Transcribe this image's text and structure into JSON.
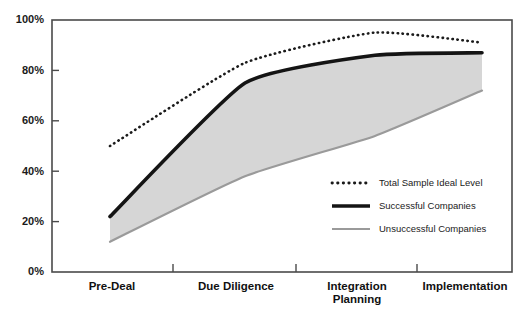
{
  "chart_data": {
    "type": "line",
    "title": "",
    "subtitle": "",
    "xlabel": "",
    "ylabel": "",
    "categories": [
      "Pre-Deal",
      "Due Diligence",
      "Integration Planning",
      "Implementation"
    ],
    "category_lines": [
      [
        "Pre-Deal"
      ],
      [
        "Due Diligence"
      ],
      [
        "Integration",
        "Planning"
      ],
      [
        "Implementation"
      ]
    ],
    "x": [
      0,
      1,
      2,
      3
    ],
    "ylim": [
      0,
      100
    ],
    "xlim": [
      -0.2,
      3.2
    ],
    "grid": false,
    "legend_position": "inside-lower-right",
    "y_ticks": [
      0,
      20,
      40,
      60,
      80,
      100
    ],
    "y_tick_labels": [
      "0%",
      "20%",
      "40%",
      "60%",
      "80%",
      "100%"
    ],
    "series": [
      {
        "name": "Total Sample Ideal Level",
        "style": "dotted",
        "color": "#1a1a1a",
        "values": [
          50,
          83,
          95,
          91
        ]
      },
      {
        "name": "Successful Companies",
        "style": "solid-thick",
        "color": "#141414",
        "values": [
          22,
          75,
          86,
          87
        ]
      },
      {
        "name": "Unsuccessful Companies",
        "style": "solid-thin",
        "color": "#9a9a9a",
        "values": [
          12,
          38,
          54,
          72
        ]
      }
    ],
    "band": {
      "name": "range-between-successful-and-unsuccessful",
      "fill": "#d6d6d6",
      "upper_series": "Successful Companies",
      "lower_series": "Unsuccessful Companies"
    }
  },
  "legend": {
    "items": [
      {
        "label": "Total Sample Ideal Level",
        "swatch": "dotted-line-swatch"
      },
      {
        "label": "Successful Companies",
        "swatch": "thick-line-swatch"
      },
      {
        "label": "Unsuccessful Companies",
        "swatch": "thin-gray-line-swatch"
      }
    ]
  },
  "axes": {
    "y_tick_labels": [
      "100%",
      "80%",
      "60%",
      "40%",
      "20%",
      "0%"
    ],
    "x_tick_labels": [
      "Pre-Deal",
      "Due Diligence",
      "Integration Planning",
      "Implementation"
    ]
  },
  "colors": {
    "frame": "#3d3d3d",
    "band_fill": "#d6d6d6",
    "successful": "#141414",
    "unsuccessful": "#9a9a9a",
    "ideal": "#1a1a1a",
    "background": "#ffffff"
  }
}
